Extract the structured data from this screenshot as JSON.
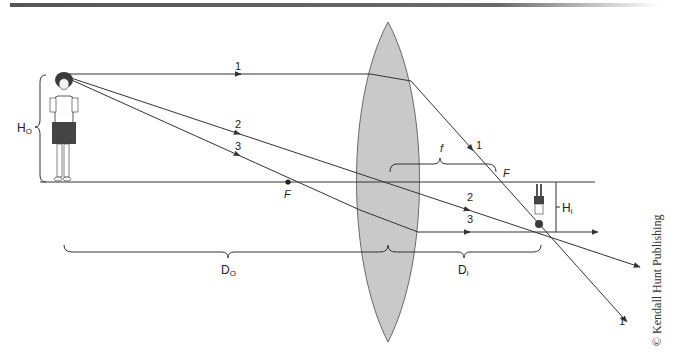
{
  "diagram": {
    "type": "converging-lens-ray-diagram",
    "colors": {
      "top_bar": "#5a5a5a",
      "lens_fill": "#c9c9c9",
      "lens_stroke": "#6a6a6a",
      "line": "#333333",
      "text": "#222222"
    },
    "labels": {
      "object_height_main": "H",
      "object_height_sub": "O",
      "image_height_main": "H",
      "image_height_sub": "i",
      "object_distance_main": "D",
      "object_distance_sub": "O",
      "image_distance_main": "D",
      "image_distance_sub": "i",
      "focal_length": "f",
      "focal_point_left": "F",
      "focal_point_right": "F",
      "ray1_label_in": "1",
      "ray1_label_mid": "1",
      "ray1_label_out": "1",
      "ray2_label_in": "2",
      "ray2_label_out": "2",
      "ray3_label_in": "3",
      "ray3_label_out": "3"
    },
    "rays": [
      {
        "id": 1,
        "description": "Parallel to axis, refracts through far focal point"
      },
      {
        "id": 2,
        "description": "Through center of lens, undeviated"
      },
      {
        "id": 3,
        "description": "Through near focal point, exits parallel to axis"
      }
    ],
    "object": {
      "description": "Upright girl figure",
      "orientation": "upright"
    },
    "image": {
      "description": "Inverted, smaller, real image of girl",
      "orientation": "inverted"
    },
    "credit": "© Kendall Hunt Publishing"
  }
}
